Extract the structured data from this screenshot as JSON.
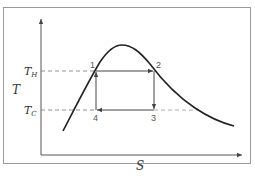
{
  "diagram": {
    "type": "T-S diagram (Carnot cycle inside vapor dome)",
    "axes": {
      "y_label": "T",
      "x_label": "S"
    },
    "levels": {
      "hot": {
        "symbol": "T",
        "subscript": "H"
      },
      "cold": {
        "symbol": "T",
        "subscript": "C"
      }
    },
    "points": [
      {
        "id": "1",
        "label": "1"
      },
      {
        "id": "2",
        "label": "2"
      },
      {
        "id": "3",
        "label": "3"
      },
      {
        "id": "4",
        "label": "4"
      }
    ],
    "processes": [
      {
        "from": "1",
        "to": "2",
        "direction": "right"
      },
      {
        "from": "2",
        "to": "3",
        "direction": "down"
      },
      {
        "from": "3",
        "to": "4",
        "direction": "left"
      },
      {
        "from": "4",
        "to": "1",
        "direction": "up"
      }
    ],
    "colors": {
      "frame": "#9a9a9a",
      "axis": "#444444",
      "curve": "#222222",
      "cycle": "#444444",
      "dashed": "#777777"
    }
  }
}
